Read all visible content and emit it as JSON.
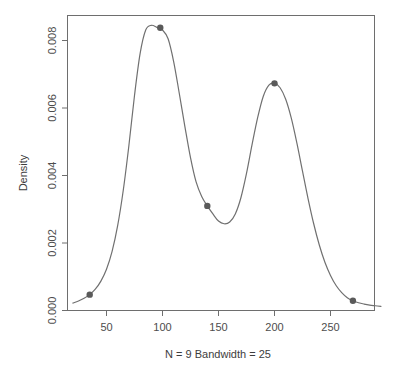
{
  "chart_data": {
    "type": "line",
    "title": "",
    "xlabel": "N = 9  Bandwidth = 25",
    "ylabel": "Density",
    "xlim": [
      20,
      295
    ],
    "ylim": [
      0.0,
      0.0088
    ],
    "xticks": [
      50,
      100,
      150,
      200,
      250
    ],
    "xtick_labels": [
      "50",
      "100",
      "150",
      "200",
      "250"
    ],
    "yticks": [
      0.0,
      0.002,
      0.004,
      0.006,
      0.008
    ],
    "ytick_labels": [
      "0.000",
      "0.002",
      "0.004",
      "0.006",
      "0.008"
    ],
    "grid": false,
    "legend": null,
    "series": [
      {
        "name": "density",
        "x": [
          20,
          25,
          30,
          35,
          40,
          45,
          50,
          55,
          60,
          65,
          70,
          75,
          80,
          85,
          90,
          95,
          100,
          105,
          110,
          115,
          120,
          125,
          130,
          135,
          140,
          145,
          150,
          155,
          160,
          165,
          170,
          175,
          180,
          185,
          190,
          195,
          200,
          205,
          210,
          215,
          220,
          225,
          230,
          235,
          240,
          245,
          250,
          255,
          260,
          265,
          270,
          275,
          280,
          285,
          290,
          295
        ],
        "values": [
          0.00022,
          0.00028,
          0.00036,
          0.00047,
          0.00063,
          0.00087,
          0.00122,
          0.00175,
          0.00252,
          0.00357,
          0.00489,
          0.00637,
          0.00761,
          0.00831,
          0.00845,
          0.00839,
          0.00831,
          0.00805,
          0.00737,
          0.00643,
          0.00545,
          0.00453,
          0.00381,
          0.00338,
          0.0031,
          0.00286,
          0.00265,
          0.00257,
          0.00262,
          0.00286,
          0.00334,
          0.00406,
          0.00492,
          0.00572,
          0.00635,
          0.00668,
          0.00673,
          0.0066,
          0.00626,
          0.0057,
          0.00496,
          0.00413,
          0.00331,
          0.00257,
          0.00194,
          0.00143,
          0.00104,
          0.00074,
          0.00053,
          0.00038,
          0.00029,
          0.00023,
          0.00019,
          0.00016,
          0.00014,
          0.00012
        ]
      }
    ],
    "markers": [
      {
        "x": 35,
        "y": 0.00047
      },
      {
        "x": 98,
        "y": 0.00838
      },
      {
        "x": 140,
        "y": 0.0031
      },
      {
        "x": 200,
        "y": 0.00673
      },
      {
        "x": 270,
        "y": 0.00029
      }
    ],
    "colors": {
      "curve": "#707070",
      "marker": "#5a5a5a",
      "axis": "#6e6e6e",
      "text": "#4d4d4d",
      "background": "#ffffff"
    }
  }
}
